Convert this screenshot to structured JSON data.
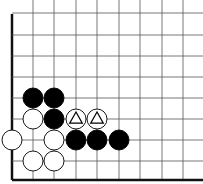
{
  "diagram": {
    "type": "go-board-fragment",
    "grid": {
      "x_lines": [
        12,
        33,
        54,
        76,
        97,
        119,
        140,
        162,
        183
      ],
      "y_lines": [
        13,
        35,
        56,
        77,
        98,
        119,
        140,
        161,
        180
      ],
      "left_edge_x": 12,
      "bottom_edge_y": 180,
      "line_color": "#555555",
      "edge_color": "#111111"
    },
    "stone_radius": 10,
    "stones": [
      {
        "color": "black",
        "col": 1,
        "row": 4
      },
      {
        "color": "black",
        "col": 2,
        "row": 4
      },
      {
        "color": "black",
        "col": 2,
        "row": 5
      },
      {
        "color": "black",
        "col": 3,
        "row": 6
      },
      {
        "color": "black",
        "col": 4,
        "row": 6
      },
      {
        "color": "black",
        "col": 5,
        "row": 6
      },
      {
        "color": "white",
        "col": 1,
        "row": 5
      },
      {
        "color": "white",
        "col": 0,
        "row": 6
      },
      {
        "color": "white",
        "col": 2,
        "row": 6
      },
      {
        "color": "white",
        "col": 1,
        "row": 7
      },
      {
        "color": "white",
        "col": 2,
        "row": 7
      },
      {
        "color": "white",
        "col": 3,
        "row": 5,
        "mark": "triangle"
      },
      {
        "color": "white",
        "col": 4,
        "row": 5,
        "mark": "triangle"
      }
    ]
  }
}
